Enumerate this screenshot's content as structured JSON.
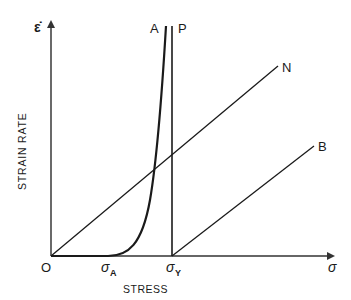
{
  "diagram": {
    "title": "",
    "y_axis": {
      "symbol": "ε̇",
      "label": "STRAIN RATE"
    },
    "x_axis": {
      "symbol": "σ",
      "label": "STRESS"
    },
    "origin_label": "O",
    "x_ticks": [
      {
        "symbol": "σ",
        "subscript": "A"
      },
      {
        "symbol": "σ",
        "subscript": "Y"
      }
    ],
    "curves": [
      {
        "label": "A",
        "description": "steep power-law curve beginning at σA"
      },
      {
        "label": "P",
        "description": "vertical line at σY (perfectly plastic)"
      },
      {
        "label": "N",
        "description": "straight line through origin (Newtonian)"
      },
      {
        "label": "B",
        "description": "straight line starting at σY (Bingham)"
      }
    ],
    "colors": {
      "line": "#1a1a1a",
      "axis": "#333333",
      "background": "#ffffff"
    }
  }
}
